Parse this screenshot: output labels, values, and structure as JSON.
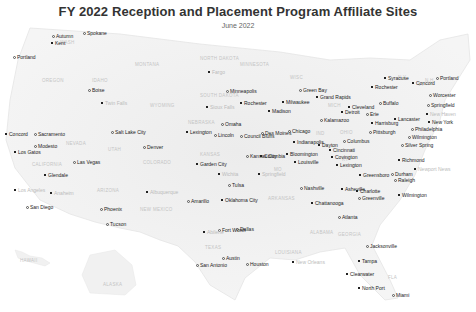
{
  "header": {
    "title": "FY 2022 Reception and Placement Program Affiliate Sites",
    "subtitle": "June 2022"
  },
  "colors": {
    "land": "#f1f1f1",
    "land_edge": "#e4e4e4",
    "city_label": "#222222",
    "state_label": "#c4c4c4",
    "marker": "#222222"
  },
  "states": [
    {
      "label": "WASH",
      "x": 60,
      "y": 40
    },
    {
      "label": "OREGON",
      "x": 42,
      "y": 78
    },
    {
      "label": "IDAHO",
      "x": 92,
      "y": 78
    },
    {
      "label": "MONTANA",
      "x": 135,
      "y": 62
    },
    {
      "label": "WYOMING",
      "x": 150,
      "y": 103
    },
    {
      "label": "NEVADA",
      "x": 66,
      "y": 141
    },
    {
      "label": "UTAH",
      "x": 108,
      "y": 147
    },
    {
      "label": "CALIFORNIA",
      "x": 32,
      "y": 162
    },
    {
      "label": "ARIZONA",
      "x": 97,
      "y": 188
    },
    {
      "label": "COLORADO",
      "x": 143,
      "y": 160
    },
    {
      "label": "NEW MEXICO",
      "x": 140,
      "y": 207
    },
    {
      "label": "NORTH DAKOTA",
      "x": 200,
      "y": 56
    },
    {
      "label": "SOUTH DAKOTA",
      "x": 200,
      "y": 93
    },
    {
      "label": "NEBRASKA",
      "x": 188,
      "y": 120
    },
    {
      "label": "KANSAS",
      "x": 200,
      "y": 152
    },
    {
      "label": "TEXAS",
      "x": 205,
      "y": 245
    },
    {
      "label": "MINNESOTA",
      "x": 240,
      "y": 62
    },
    {
      "label": "WISC",
      "x": 290,
      "y": 75
    },
    {
      "label": "MICH",
      "x": 328,
      "y": 103
    },
    {
      "label": "OHIO",
      "x": 340,
      "y": 130
    },
    {
      "label": "IND",
      "x": 316,
      "y": 131
    },
    {
      "label": "MO",
      "x": 274,
      "y": 167
    },
    {
      "label": "ARKANSAS",
      "x": 268,
      "y": 196
    },
    {
      "label": "KY",
      "x": 342,
      "y": 157
    },
    {
      "label": "ALABAMA",
      "x": 310,
      "y": 230
    },
    {
      "label": "GEORGIA",
      "x": 338,
      "y": 232
    },
    {
      "label": "LOUISIANA",
      "x": 275,
      "y": 250
    },
    {
      "label": "FLA",
      "x": 388,
      "y": 275
    },
    {
      "label": "VT",
      "x": 418,
      "y": 82
    },
    {
      "label": "N.H.",
      "x": 425,
      "y": 78
    },
    {
      "label": "N.Y.",
      "x": 398,
      "y": 75
    },
    {
      "label": "HAWAII",
      "x": 20,
      "y": 258
    },
    {
      "label": "ALASKA",
      "x": 103,
      "y": 282
    }
  ],
  "cities": [
    {
      "label": "Autumn",
      "x": 56,
      "y": 34,
      "marker": "ring"
    },
    {
      "label": "Kent",
      "x": 55,
      "y": 41,
      "marker": "dot"
    },
    {
      "label": "Spokane",
      "x": 87,
      "y": 31,
      "marker": "ring"
    },
    {
      "label": "Portland",
      "x": 17,
      "y": 55,
      "marker": "ring"
    },
    {
      "label": "Boise",
      "x": 92,
      "y": 88,
      "marker": "ring"
    },
    {
      "label": "Twin Falls",
      "x": 105,
      "y": 101,
      "marker": "dot",
      "minor": true
    },
    {
      "label": "Sacramento",
      "x": 38,
      "y": 132,
      "marker": "ring"
    },
    {
      "label": "Concord",
      "x": 9,
      "y": 132,
      "marker": "dot"
    },
    {
      "label": "Modesto",
      "x": 38,
      "y": 144,
      "marker": "ring"
    },
    {
      "label": "Los Gatos",
      "x": 18,
      "y": 150,
      "marker": "dot"
    },
    {
      "label": "Salt Lake City",
      "x": 115,
      "y": 130,
      "marker": "ring"
    },
    {
      "label": "Las Vegas",
      "x": 77,
      "y": 160,
      "marker": "ring"
    },
    {
      "label": "Glendale",
      "x": 48,
      "y": 173,
      "marker": "dot"
    },
    {
      "label": "Los Angeles",
      "x": 18,
      "y": 188,
      "marker": "dot",
      "minor": true
    },
    {
      "label": "Anaheim",
      "x": 54,
      "y": 191,
      "marker": "dot",
      "minor": true
    },
    {
      "label": "San Diego",
      "x": 30,
      "y": 205,
      "marker": "ring"
    },
    {
      "label": "Phoenix",
      "x": 104,
      "y": 207,
      "marker": "ring"
    },
    {
      "label": "Tucson",
      "x": 110,
      "y": 222,
      "marker": "ring"
    },
    {
      "label": "Denver",
      "x": 147,
      "y": 145,
      "marker": "ring"
    },
    {
      "label": "Fargo",
      "x": 212,
      "y": 70,
      "marker": "dot",
      "minor": true
    },
    {
      "label": "Sioux Falls",
      "x": 210,
      "y": 105,
      "marker": "dot",
      "minor": true
    },
    {
      "label": "Minneapolis",
      "x": 230,
      "y": 89,
      "marker": "ring"
    },
    {
      "label": "Rochester",
      "x": 244,
      "y": 101,
      "marker": "dot"
    },
    {
      "label": "Omaha",
      "x": 225,
      "y": 122,
      "marker": "ring"
    },
    {
      "label": "Council Bluffs",
      "x": 244,
      "y": 134,
      "marker": "ring"
    },
    {
      "label": "Lincoln",
      "x": 218,
      "y": 133,
      "marker": "ring"
    },
    {
      "label": "Lexington",
      "x": 190,
      "y": 130,
      "marker": "dot"
    },
    {
      "label": "Des Moines",
      "x": 265,
      "y": 131,
      "marker": "ring"
    },
    {
      "label": "Madison",
      "x": 272,
      "y": 109,
      "marker": "dot"
    },
    {
      "label": "Milwaukee",
      "x": 286,
      "y": 100,
      "marker": "dot"
    },
    {
      "label": "Green Bay",
      "x": 303,
      "y": 88,
      "marker": "ring"
    },
    {
      "label": "Chicago",
      "x": 292,
      "y": 129,
      "marker": "ring"
    },
    {
      "label": "Indianapolis",
      "x": 297,
      "y": 140,
      "marker": "dot"
    },
    {
      "label": "Bloomington",
      "x": 290,
      "y": 152,
      "marker": "dot"
    },
    {
      "label": "Louisville",
      "x": 298,
      "y": 160,
      "marker": "dot"
    },
    {
      "label": "Grand Rapids",
      "x": 320,
      "y": 95,
      "marker": "dot"
    },
    {
      "label": "Kalamazoo",
      "x": 324,
      "y": 118,
      "marker": "ring"
    },
    {
      "label": "Detroit",
      "x": 345,
      "y": 110,
      "marker": "dot"
    },
    {
      "label": "Dayton",
      "x": 322,
      "y": 143,
      "marker": "dot"
    },
    {
      "label": "Columbus",
      "x": 347,
      "y": 139,
      "marker": "ring"
    },
    {
      "label": "Cincinnati",
      "x": 333,
      "y": 148,
      "marker": "dot"
    },
    {
      "label": "Covington",
      "x": 335,
      "y": 155,
      "marker": "dot"
    },
    {
      "label": "Lexington",
      "x": 340,
      "y": 163,
      "marker": "dot"
    },
    {
      "label": "Cleveland",
      "x": 352,
      "y": 105,
      "marker": "dot"
    },
    {
      "label": "Erie",
      "x": 370,
      "y": 112,
      "marker": "ring"
    },
    {
      "label": "Buffalo",
      "x": 383,
      "y": 101,
      "marker": "ring"
    },
    {
      "label": "Rochester",
      "x": 375,
      "y": 85,
      "marker": "dot"
    },
    {
      "label": "Syracuse",
      "x": 388,
      "y": 76,
      "marker": "dot"
    },
    {
      "label": "Concord",
      "x": 416,
      "y": 81,
      "marker": "dot"
    },
    {
      "label": "Portland",
      "x": 440,
      "y": 76,
      "marker": "ring"
    },
    {
      "label": "Worcester",
      "x": 433,
      "y": 93,
      "marker": "ring"
    },
    {
      "label": "Springfield",
      "x": 431,
      "y": 103,
      "marker": "ring"
    },
    {
      "label": "New Haven",
      "x": 430,
      "y": 112,
      "marker": "dot",
      "minor": true
    },
    {
      "label": "New York",
      "x": 432,
      "y": 120,
      "marker": "dot"
    },
    {
      "label": "Lancaster",
      "x": 398,
      "y": 117,
      "marker": "dot"
    },
    {
      "label": "Harrisburg",
      "x": 375,
      "y": 121,
      "marker": "dot"
    },
    {
      "label": "Pittsburgh",
      "x": 373,
      "y": 130,
      "marker": "ring"
    },
    {
      "label": "Philadelphia",
      "x": 415,
      "y": 127,
      "marker": "ring"
    },
    {
      "label": "Wilmington",
      "x": 412,
      "y": 135,
      "marker": "ring"
    },
    {
      "label": "Silver Spring",
      "x": 405,
      "y": 143,
      "marker": "ring"
    },
    {
      "label": "Richmond",
      "x": 402,
      "y": 158,
      "marker": "dot"
    },
    {
      "label": "Newport News",
      "x": 418,
      "y": 167,
      "marker": "dot",
      "minor": true
    },
    {
      "label": "Durham",
      "x": 395,
      "y": 172,
      "marker": "ring"
    },
    {
      "label": "Raleigh",
      "x": 398,
      "y": 178,
      "marker": "ring"
    },
    {
      "label": "Greensboro",
      "x": 363,
      "y": 173,
      "marker": "dot"
    },
    {
      "label": "Charlotte",
      "x": 360,
      "y": 189,
      "marker": "dot"
    },
    {
      "label": "Asheville",
      "x": 345,
      "y": 187,
      "marker": "dot"
    },
    {
      "label": "Greenville",
      "x": 362,
      "y": 196,
      "marker": "ring"
    },
    {
      "label": "Wilmington",
      "x": 402,
      "y": 193,
      "marker": "dot"
    },
    {
      "label": "Nashville",
      "x": 304,
      "y": 186,
      "marker": "ring"
    },
    {
      "label": "Chattanooga",
      "x": 315,
      "y": 201,
      "marker": "dot"
    },
    {
      "label": "Atlanta",
      "x": 342,
      "y": 215,
      "marker": "ring"
    },
    {
      "label": "Jacksonville",
      "x": 370,
      "y": 244,
      "marker": "ring"
    },
    {
      "label": "Tampa",
      "x": 362,
      "y": 259,
      "marker": "dot"
    },
    {
      "label": "Clearwater",
      "x": 350,
      "y": 272,
      "marker": "dot"
    },
    {
      "label": "North Port",
      "x": 362,
      "y": 286,
      "marker": "dot"
    },
    {
      "label": "Miami",
      "x": 396,
      "y": 293,
      "marker": "ring"
    },
    {
      "label": "New Orleans",
      "x": 296,
      "y": 260,
      "marker": "dot",
      "minor": true
    },
    {
      "label": "Kansas City",
      "x": 250,
      "y": 154,
      "marker": "ring"
    },
    {
      "label": "Columbia",
      "x": 264,
      "y": 154,
      "marker": "dot"
    },
    {
      "label": "Garden City",
      "x": 200,
      "y": 162,
      "marker": "dot"
    },
    {
      "label": "Wichita",
      "x": 222,
      "y": 172,
      "marker": "dot",
      "minor": true
    },
    {
      "label": "Springfield",
      "x": 262,
      "y": 172,
      "marker": "dot",
      "minor": true
    },
    {
      "label": "Tulsa",
      "x": 232,
      "y": 183,
      "marker": "ring"
    },
    {
      "label": "Oklahoma City",
      "x": 225,
      "y": 198,
      "marker": "dot"
    },
    {
      "label": "Amarillo",
      "x": 191,
      "y": 199,
      "marker": "ring"
    },
    {
      "label": "Albuquerque",
      "x": 150,
      "y": 190,
      "marker": "dot",
      "minor": true
    },
    {
      "label": "Fort Worth",
      "x": 222,
      "y": 228,
      "marker": "ring"
    },
    {
      "label": "Dallas",
      "x": 240,
      "y": 227,
      "marker": "ring"
    },
    {
      "label": "Abilene",
      "x": 207,
      "y": 230,
      "marker": "dot",
      "minor": true
    },
    {
      "label": "Austin",
      "x": 226,
      "y": 256,
      "marker": "ring"
    },
    {
      "label": "San Antonio",
      "x": 200,
      "y": 263,
      "marker": "ring"
    },
    {
      "label": "Houston",
      "x": 250,
      "y": 262,
      "marker": "ring"
    }
  ]
}
